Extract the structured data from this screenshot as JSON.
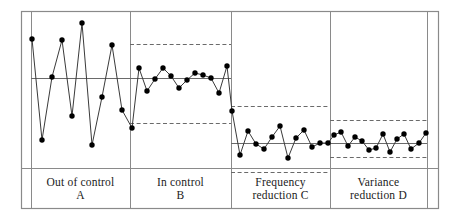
{
  "figure": {
    "frame": {
      "x": 21,
      "y": 11,
      "width": 417,
      "height": 197,
      "color": "#8a8a8a"
    },
    "background": "#ffffff",
    "line_color": "#3a3a3a",
    "marker_color": "#000000",
    "center_line_color": "#6a6a6a",
    "limit_line_color": "#6a6a6a",
    "divider_color": "#8a8a8a",
    "label_divider_y": 168
  },
  "chart_data": {
    "type": "line",
    "xlabel": "",
    "ylabel": "",
    "grid": false,
    "legend": "none",
    "xlim": [
      21,
      438
    ],
    "ylim": [
      208,
      11
    ],
    "y_axis_inverted_pixels": true,
    "series": [
      {
        "name": "measurement",
        "x": [
          32,
          42,
          52,
          62,
          72,
          82,
          92,
          102,
          112,
          122,
          132,
          139,
          147,
          155,
          163,
          171,
          179,
          187,
          195,
          203,
          211,
          219,
          227,
          232,
          240,
          248,
          256,
          264,
          272,
          280,
          288,
          296,
          304,
          312,
          320,
          328,
          334,
          341,
          348,
          355,
          362,
          369,
          376,
          383,
          390,
          397,
          404,
          411,
          419,
          426
        ],
        "values": [
          39,
          140,
          77,
          40,
          116,
          23,
          145,
          97,
          45,
          110,
          128,
          68,
          91,
          79,
          68,
          76,
          88,
          80,
          73,
          75,
          78,
          93,
          66,
          111,
          155,
          131,
          144,
          149,
          137,
          126,
          158,
          138,
          130,
          147,
          143,
          143,
          135,
          132,
          146,
          137,
          141,
          150,
          148,
          134,
          152,
          139,
          134,
          149,
          143,
          133
        ]
      }
    ],
    "phases": [
      {
        "id": "A",
        "label_line1": "Out of control",
        "label_line2": "A",
        "x_start": 31,
        "x_end": 130,
        "center_line": 78,
        "upper_limit": null,
        "lower_limit": null,
        "point_count": 10,
        "description": "large variation, no control limits"
      },
      {
        "id": "B",
        "label_line1": "In control",
        "label_line2": "B",
        "x_start": 130,
        "x_end": 231,
        "center_line": 78,
        "upper_limit": 44,
        "lower_limit": 123,
        "point_count": 13,
        "description": "stable within control limits"
      },
      {
        "id": "C",
        "label_line1": "Frequency",
        "label_line2": "reduction C",
        "x_start": 231,
        "x_end": 330,
        "center_line": 143,
        "upper_limit": 106,
        "lower_limit": 172,
        "point_count": 13,
        "description": "mean shifted down, same spread"
      },
      {
        "id": "D",
        "label_line1": "Variance",
        "label_line2": "reduction D",
        "x_start": 330,
        "x_end": 427,
        "center_line": 143,
        "upper_limit": 120,
        "lower_limit": 157,
        "point_count": 14,
        "description": "narrowed control limits"
      }
    ],
    "vertical_rules": [
      31,
      130,
      231,
      330,
      427
    ]
  }
}
